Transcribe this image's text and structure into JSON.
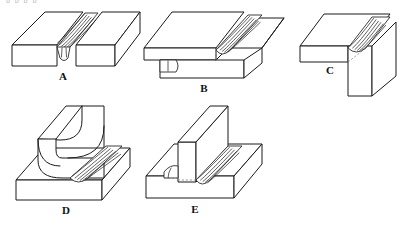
{
  "figure": {
    "background_color": "#ffffff",
    "line_color": "#1a1a1a",
    "clipped_text_top": "p p p p",
    "joints": [
      {
        "id": "A",
        "label": "A",
        "name": "v-groove-butt-joint",
        "description": "Single V-groove butt weld between two flat plates with root penetration bead on underside",
        "weld_type": "butt",
        "bead_ripples": 11
      },
      {
        "id": "B",
        "label": "B",
        "name": "lap-joint",
        "description": "Lap joint of two offset plates with fillet weld along the overlap edge",
        "weld_type": "fillet",
        "bead_ripples": 12
      },
      {
        "id": "C",
        "label": "C",
        "name": "corner-joint",
        "description": "Corner joint with vertical plate welded to the edge of a horizontal plate",
        "weld_type": "fillet",
        "bead_ripples": 12
      },
      {
        "id": "D",
        "label": "D",
        "name": "curved-edge-joint",
        "description": "Curved concave plate welded to a flat base plate with a fillet bead along the contour",
        "weld_type": "fillet",
        "bead_ripples": 10
      },
      {
        "id": "E",
        "label": "E",
        "name": "tee-joint",
        "description": "Tee joint with upright plate welded to base plate by double fillet welds on both sides",
        "weld_type": "double-fillet",
        "bead_ripples": 10
      }
    ]
  }
}
